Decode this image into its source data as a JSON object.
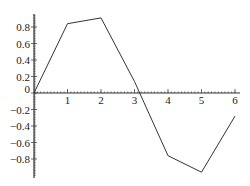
{
  "chart_data": {
    "type": "line",
    "title": "",
    "xlabel": "",
    "ylabel": "",
    "x": [
      0,
      1,
      2,
      3,
      4,
      5,
      6
    ],
    "series": [
      {
        "name": "y",
        "values": [
          0,
          0.84,
          0.91,
          0.14,
          -0.76,
          -0.96,
          -0.28
        ]
      }
    ],
    "xlim": [
      0,
      6.1
    ],
    "ylim": [
      -1.0,
      0.96
    ],
    "x_ticks": [
      1,
      2,
      3,
      4,
      5,
      6
    ],
    "x_tick_labels": [
      "1",
      "2",
      "3",
      "4",
      "5",
      "6"
    ],
    "y_ticks": [
      0.8,
      0.6,
      0.4,
      0.2,
      0,
      -0.2,
      -0.4,
      -0.6,
      -0.8
    ],
    "y_tick_labels": [
      "0.8",
      "0.6",
      "0.4",
      "0.2",
      "0",
      "−0.2",
      "−0.4",
      "−0.6",
      "−0.8"
    ],
    "grid": false,
    "legend": "none",
    "line_color": "#333333"
  }
}
